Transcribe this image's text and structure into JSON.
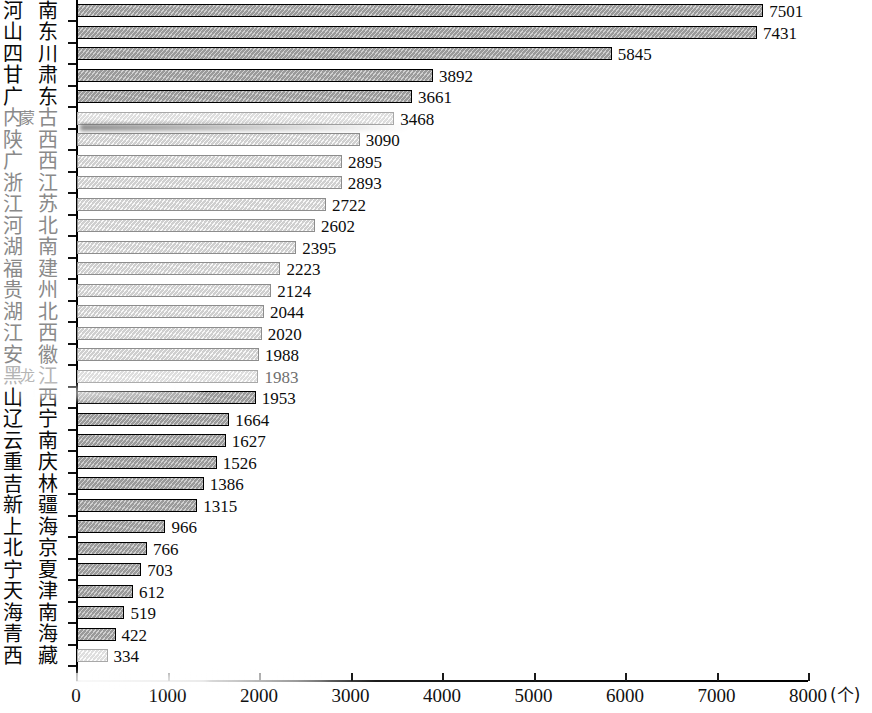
{
  "chart_data": {
    "type": "bar",
    "orientation": "horizontal",
    "title": "",
    "xlabel": "个",
    "ylabel": "",
    "xlim": [
      0,
      8000
    ],
    "xticks": [
      0,
      1000,
      2000,
      3000,
      4000,
      5000,
      6000,
      7000,
      8000
    ],
    "xtick_labels": [
      "0",
      "1000",
      "2000",
      "3000",
      "4000",
      "5000",
      "6000",
      "7000",
      "8000"
    ],
    "unit_label": "(个)",
    "grid": false,
    "legend": null,
    "categories": [
      "河南",
      "山东",
      "四川",
      "甘肃",
      "广东",
      "内蒙古",
      "陕西",
      "广西",
      "浙江",
      "江苏",
      "河北",
      "湖南",
      "福建",
      "贵州",
      "湖北",
      "江西",
      "安徽",
      "黑龙江",
      "山西",
      "辽宁",
      "云南",
      "重庆",
      "吉林",
      "新疆",
      "上海",
      "北京",
      "宁夏",
      "天津",
      "海南",
      "青海",
      "西藏"
    ],
    "values": [
      7501,
      7431,
      5845,
      3892,
      3661,
      3468,
      3090,
      2895,
      2893,
      2722,
      2602,
      2395,
      2223,
      2124,
      2044,
      2020,
      1988,
      1983,
      1953,
      1664,
      1627,
      1526,
      1386,
      1315,
      966,
      766,
      703,
      612,
      519,
      422,
      334
    ]
  },
  "rows": [
    {
      "label": "河南",
      "c1": "河",
      "c2": "南",
      "c3": "",
      "value": 7501,
      "value_text": "7501",
      "tone": "dark",
      "fade": "dark"
    },
    {
      "label": "山东",
      "c1": "山",
      "c2": "东",
      "c3": "",
      "value": 7431,
      "value_text": "7431",
      "tone": "dark",
      "fade": "dark"
    },
    {
      "label": "四川",
      "c1": "四",
      "c2": "川",
      "c3": "",
      "value": 5845,
      "value_text": "5845",
      "tone": "dark",
      "fade": "dark"
    },
    {
      "label": "甘肃",
      "c1": "甘",
      "c2": "肃",
      "c3": "",
      "value": 3892,
      "value_text": "3892",
      "tone": "dark",
      "fade": "dark"
    },
    {
      "label": "广东",
      "c1": "广",
      "c2": "东",
      "c3": "",
      "value": 3661,
      "value_text": "3661",
      "tone": "dark",
      "fade": "dark"
    },
    {
      "label": "内蒙古",
      "c1": "内",
      "c2": "古",
      "c3": "蒙",
      "value": 3468,
      "value_text": "3468",
      "tone": "ghost",
      "fade": "mid"
    },
    {
      "label": "陕西",
      "c1": "陕",
      "c2": "西",
      "c3": "",
      "value": 3090,
      "value_text": "3090",
      "tone": "light",
      "fade": "mid"
    },
    {
      "label": "广西",
      "c1": "广",
      "c2": "西",
      "c3": "",
      "value": 2895,
      "value_text": "2895",
      "tone": "light",
      "fade": "mid"
    },
    {
      "label": "浙江",
      "c1": "浙",
      "c2": "江",
      "c3": "",
      "value": 2893,
      "value_text": "2893",
      "tone": "light",
      "fade": "mid"
    },
    {
      "label": "江苏",
      "c1": "江",
      "c2": "苏",
      "c3": "",
      "value": 2722,
      "value_text": "2722",
      "tone": "light",
      "fade": "mid"
    },
    {
      "label": "河北",
      "c1": "河",
      "c2": "北",
      "c3": "",
      "value": 2602,
      "value_text": "2602",
      "tone": "light",
      "fade": "mid"
    },
    {
      "label": "湖南",
      "c1": "湖",
      "c2": "南",
      "c3": "",
      "value": 2395,
      "value_text": "2395",
      "tone": "light",
      "fade": "mid"
    },
    {
      "label": "福建",
      "c1": "福",
      "c2": "建",
      "c3": "",
      "value": 2223,
      "value_text": "2223",
      "tone": "light",
      "fade": "mid"
    },
    {
      "label": "贵州",
      "c1": "贵",
      "c2": "州",
      "c3": "",
      "value": 2124,
      "value_text": "2124",
      "tone": "light",
      "fade": "mid"
    },
    {
      "label": "湖北",
      "c1": "湖",
      "c2": "北",
      "c3": "",
      "value": 2044,
      "value_text": "2044",
      "tone": "light",
      "fade": "mid"
    },
    {
      "label": "江西",
      "c1": "江",
      "c2": "西",
      "c3": "",
      "value": 2020,
      "value_text": "2020",
      "tone": "light",
      "fade": "mid"
    },
    {
      "label": "安徽",
      "c1": "安",
      "c2": "徽",
      "c3": "",
      "value": 1988,
      "value_text": "1988",
      "tone": "light",
      "fade": "mid"
    },
    {
      "label": "黑龙江",
      "c1": "黑",
      "c2": "江",
      "c3": "龙",
      "value": 1983,
      "value_text": "1983",
      "tone": "ghost",
      "fade": "light"
    },
    {
      "label": "山西",
      "c1": "山",
      "c2": "西",
      "c3": "",
      "value": 1953,
      "value_text": "1953",
      "tone": "dark",
      "fade": "dark"
    },
    {
      "label": "辽宁",
      "c1": "辽",
      "c2": "宁",
      "c3": "",
      "value": 1664,
      "value_text": "1664",
      "tone": "dark",
      "fade": "dark"
    },
    {
      "label": "云南",
      "c1": "云",
      "c2": "南",
      "c3": "",
      "value": 1627,
      "value_text": "1627",
      "tone": "dark",
      "fade": "dark"
    },
    {
      "label": "重庆",
      "c1": "重",
      "c2": "庆",
      "c3": "",
      "value": 1526,
      "value_text": "1526",
      "tone": "dark",
      "fade": "dark"
    },
    {
      "label": "吉林",
      "c1": "吉",
      "c2": "林",
      "c3": "",
      "value": 1386,
      "value_text": "1386",
      "tone": "dark",
      "fade": "dark"
    },
    {
      "label": "新疆",
      "c1": "新",
      "c2": "疆",
      "c3": "",
      "value": 1315,
      "value_text": "1315",
      "tone": "dark",
      "fade": "dark"
    },
    {
      "label": "上海",
      "c1": "上",
      "c2": "海",
      "c3": "",
      "value": 966,
      "value_text": "966",
      "tone": "dark",
      "fade": "dark"
    },
    {
      "label": "北京",
      "c1": "北",
      "c2": "京",
      "c3": "",
      "value": 766,
      "value_text": "766",
      "tone": "dark",
      "fade": "dark"
    },
    {
      "label": "宁夏",
      "c1": "宁",
      "c2": "夏",
      "c3": "",
      "value": 703,
      "value_text": "703",
      "tone": "dark",
      "fade": "dark"
    },
    {
      "label": "天津",
      "c1": "天",
      "c2": "津",
      "c3": "",
      "value": 612,
      "value_text": "612",
      "tone": "dark",
      "fade": "dark"
    },
    {
      "label": "海南",
      "c1": "海",
      "c2": "南",
      "c3": "",
      "value": 519,
      "value_text": "519",
      "tone": "dark",
      "fade": "dark"
    },
    {
      "label": "青海",
      "c1": "青",
      "c2": "海",
      "c3": "",
      "value": 422,
      "value_text": "422",
      "tone": "dark",
      "fade": "dark"
    },
    {
      "label": "西藏",
      "c1": "西",
      "c2": "藏",
      "c3": "",
      "value": 334,
      "value_text": "334",
      "tone": "ghost",
      "fade": "dark"
    }
  ],
  "axis": {
    "ticks": [
      {
        "value": 0,
        "label": "0"
      },
      {
        "value": 1000,
        "label": "1000"
      },
      {
        "value": 2000,
        "label": "2000"
      },
      {
        "value": 3000,
        "label": "3000"
      },
      {
        "value": 4000,
        "label": "4000"
      },
      {
        "value": 5000,
        "label": "5000"
      },
      {
        "value": 6000,
        "label": "6000"
      },
      {
        "value": 7000,
        "label": "7000"
      },
      {
        "value": 8000,
        "label": "8000"
      }
    ],
    "unit": "(个)",
    "max": 8000
  },
  "colors": {
    "bar_fill_dark": "#9a9a9a",
    "bar_fill_mid": "#b9b9b9",
    "bar_fill_light": "#cfcfcf",
    "bar_outline": "#1a1a1a",
    "axis": "#000000",
    "text": "#0c0c0c",
    "background": "#ffffff"
  }
}
